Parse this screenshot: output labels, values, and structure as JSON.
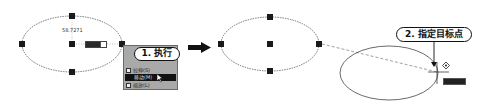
{
  "steps": {
    "step1": {
      "label": "1. 执行"
    },
    "step2": {
      "label": "2. 指定目标点"
    }
  },
  "left_panel": {
    "dimension_text": "58.7271",
    "dynamic_input_value": "",
    "context_menu": {
      "items": [
        {
          "label": "拉伸(S)",
          "icon": "stretch-icon",
          "active": false
        },
        {
          "label": "移动(M)",
          "icon": "move-icon",
          "active": true
        },
        {
          "label": "缩放(L)",
          "icon": "scale-icon",
          "active": false
        }
      ]
    }
  },
  "right_panel": {
    "tooltip_value": ""
  },
  "colors": {
    "ellipse_stroke": "#555555",
    "grip": "#1a1a1a",
    "menu_bg": "#a9a9a9",
    "menu_active": "#111111",
    "arrow": "#111111"
  }
}
